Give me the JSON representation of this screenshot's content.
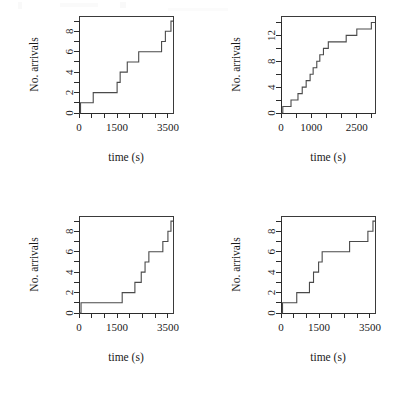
{
  "figure": {
    "title": "",
    "layout": "2x2 grid of step (counting process) plots",
    "background_color": "#ffffff",
    "line_color": "#4a4a4a",
    "axis_color": "#2b2b2b"
  },
  "chart_data": [
    {
      "type": "line",
      "subtype": "step",
      "panel": "top-left",
      "title": "",
      "xlabel": "time (s)",
      "ylabel": "No. arrivals",
      "xlim": [
        0,
        3700
      ],
      "ylim": [
        0,
        9.5
      ],
      "grid": false,
      "legend": "none",
      "xticks": [
        0,
        500,
        1000,
        1500,
        2000,
        2500,
        3000,
        3500
      ],
      "xticklabels": [
        "0",
        "",
        "",
        "1500",
        "",
        "",
        "",
        "3500"
      ],
      "yticks": [
        0,
        1,
        2,
        3,
        4,
        5,
        6,
        7,
        8,
        9
      ],
      "yticklabels": [
        "0",
        "",
        "2",
        "",
        "4",
        "",
        "6",
        "",
        "8",
        ""
      ],
      "x": [
        0,
        60,
        560,
        1500,
        1620,
        1900,
        2250,
        2350,
        3250,
        3400,
        3620
      ],
      "y": [
        0,
        1,
        2,
        3,
        4,
        5,
        5,
        6,
        7,
        8,
        9
      ],
      "n_arrivals": 9
    },
    {
      "type": "line",
      "subtype": "step",
      "panel": "top-right",
      "title": "",
      "xlabel": "time (s)",
      "ylabel": "No. arrivals",
      "xlim": [
        0,
        3100
      ],
      "ylim": [
        0,
        15
      ],
      "grid": false,
      "legend": "none",
      "xticks": [
        0,
        500,
        1000,
        1500,
        2000,
        2500,
        3000
      ],
      "xticklabels": [
        "0",
        "",
        "1000",
        "",
        "",
        "2500",
        ""
      ],
      "yticks": [
        0,
        2,
        4,
        6,
        8,
        10,
        12,
        14
      ],
      "yticklabels": [
        "0",
        "",
        "4",
        "",
        "8",
        "",
        "12",
        ""
      ],
      "x": [
        0,
        60,
        330,
        560,
        700,
        830,
        960,
        1060,
        1180,
        1280,
        1400,
        1560,
        1800,
        2150,
        2500,
        2800,
        2980
      ],
      "y": [
        0,
        1,
        2,
        3,
        4,
        5,
        6,
        7,
        8,
        9,
        10,
        11,
        11,
        12,
        13,
        13,
        14
      ],
      "n_arrivals": 14
    },
    {
      "type": "line",
      "subtype": "step",
      "panel": "bottom-left",
      "title": "",
      "xlabel": "time (s)",
      "ylabel": "No. arrivals",
      "xlim": [
        0,
        3700
      ],
      "ylim": [
        0,
        9.5
      ],
      "grid": false,
      "legend": "none",
      "xticks": [
        0,
        500,
        1000,
        1500,
        2000,
        2500,
        3000,
        3500
      ],
      "xticklabels": [
        "0",
        "",
        "",
        "1500",
        "",
        "",
        "",
        "3500"
      ],
      "yticks": [
        0,
        1,
        2,
        3,
        4,
        5,
        6,
        7,
        8,
        9
      ],
      "yticklabels": [
        "0",
        "",
        "2",
        "",
        "4",
        "",
        "6",
        "",
        "8",
        ""
      ],
      "x": [
        0,
        80,
        1700,
        2200,
        2450,
        2600,
        2750,
        3000,
        3300,
        3500,
        3620
      ],
      "y": [
        0,
        1,
        2,
        3,
        4,
        5,
        6,
        6,
        7,
        8,
        9
      ],
      "n_arrivals": 9
    },
    {
      "type": "line",
      "subtype": "step",
      "panel": "bottom-right",
      "title": "",
      "xlabel": "time (s)",
      "ylabel": "No. arrivals",
      "xlim": [
        0,
        3700
      ],
      "ylim": [
        0,
        9.5
      ],
      "grid": false,
      "legend": "none",
      "xticks": [
        0,
        500,
        1000,
        1500,
        2000,
        2500,
        3000,
        3500
      ],
      "xticklabels": [
        "0",
        "",
        "",
        "1500",
        "",
        "",
        "",
        "3500"
      ],
      "yticks": [
        0,
        1,
        2,
        3,
        4,
        5,
        6,
        7,
        8,
        9
      ],
      "yticklabels": [
        "0",
        "",
        "2",
        "",
        "4",
        "",
        "6",
        "",
        "8",
        ""
      ],
      "x": [
        0,
        60,
        620,
        1120,
        1280,
        1480,
        1620,
        2500,
        2700,
        3420,
        3620
      ],
      "y": [
        0,
        1,
        2,
        3,
        4,
        5,
        6,
        6,
        7,
        8,
        9
      ],
      "n_arrivals": 9
    }
  ],
  "panels": [
    {
      "id": "panel-1",
      "xlabel": "time (s)",
      "ylabel": "No. arrivals",
      "xticklabels": [
        {
          "v": "0",
          "x": 0
        },
        {
          "v": "1500",
          "x": 1500
        },
        {
          "v": "3500",
          "x": 3500
        }
      ],
      "yticklabels": [
        {
          "v": "0",
          "y": 0
        },
        {
          "v": "2",
          "y": 2
        },
        {
          "v": "4",
          "y": 4
        },
        {
          "v": "6",
          "y": 6
        },
        {
          "v": "8",
          "y": 8
        }
      ]
    },
    {
      "id": "panel-2",
      "xlabel": "time (s)",
      "ylabel": "No. arrivals",
      "xticklabels": [
        {
          "v": "0",
          "x": 0
        },
        {
          "v": "1000",
          "x": 1000
        },
        {
          "v": "2500",
          "x": 2500
        }
      ],
      "yticklabels": [
        {
          "v": "0",
          "y": 0
        },
        {
          "v": "4",
          "y": 4
        },
        {
          "v": "8",
          "y": 8
        },
        {
          "v": "12",
          "y": 12
        }
      ]
    },
    {
      "id": "panel-3",
      "xlabel": "time (s)",
      "ylabel": "No. arrivals",
      "xticklabels": [
        {
          "v": "0",
          "x": 0
        },
        {
          "v": "1500",
          "x": 1500
        },
        {
          "v": "3500",
          "x": 3500
        }
      ],
      "yticklabels": [
        {
          "v": "0",
          "y": 0
        },
        {
          "v": "2",
          "y": 2
        },
        {
          "v": "4",
          "y": 4
        },
        {
          "v": "6",
          "y": 6
        },
        {
          "v": "8",
          "y": 8
        }
      ]
    },
    {
      "id": "panel-4",
      "xlabel": "time (s)",
      "ylabel": "No. arrivals",
      "xticklabels": [
        {
          "v": "0",
          "x": 0
        },
        {
          "v": "1500",
          "x": 1500
        },
        {
          "v": "3500",
          "x": 3500
        }
      ],
      "yticklabels": [
        {
          "v": "0",
          "y": 0
        },
        {
          "v": "2",
          "y": 2
        },
        {
          "v": "4",
          "y": 4
        },
        {
          "v": "6",
          "y": 6
        },
        {
          "v": "8",
          "y": 8
        }
      ]
    }
  ]
}
